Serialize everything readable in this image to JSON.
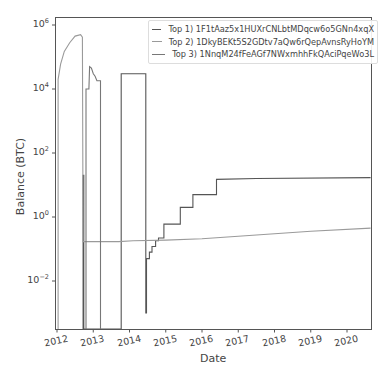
{
  "chart_data": {
    "type": "line",
    "title": "",
    "xlabel": "Date",
    "ylabel": "Balance (BTC)",
    "yscale": "log",
    "xlim": [
      2011.95,
      2020.65
    ],
    "ylim": [
      0.0003,
      1500000
    ],
    "grid": false,
    "legend_position": "upper right",
    "x_ticks": [
      "2012",
      "2013",
      "2014",
      "2015",
      "2016",
      "2017",
      "2018",
      "2019",
      "2020"
    ],
    "y_ticks": [
      {
        "base": "10",
        "exp": "6",
        "value": 1000000
      },
      {
        "base": "10",
        "exp": "4",
        "value": 10000
      },
      {
        "base": "10",
        "exp": "2",
        "value": 100
      },
      {
        "base": "10",
        "exp": "0",
        "value": 1
      },
      {
        "base": "10",
        "exp": "−2",
        "value": 0.01
      }
    ],
    "series": [
      {
        "name": "Top 1) 1F1tAaz5x1HUXrCNLbtMDqcw6o5GNn4xqX",
        "color": "#555555",
        "points": [
          [
            2012.72,
            0.0003
          ],
          [
            2012.72,
            20
          ],
          [
            2012.74,
            20
          ],
          [
            2012.74,
            0.0003
          ],
          [
            2013.77,
            0.0003
          ],
          [
            2013.77,
            30000
          ],
          [
            2014.45,
            30000
          ],
          [
            2014.45,
            0.001
          ],
          [
            2014.47,
            0.001
          ],
          [
            2014.47,
            0.05
          ],
          [
            2014.55,
            0.05
          ],
          [
            2014.55,
            0.08
          ],
          [
            2014.62,
            0.08
          ],
          [
            2014.62,
            0.12
          ],
          [
            2014.72,
            0.12
          ],
          [
            2014.72,
            0.18
          ],
          [
            2014.8,
            0.18
          ],
          [
            2014.8,
            0.22
          ],
          [
            2014.95,
            0.22
          ],
          [
            2014.95,
            0.6
          ],
          [
            2015.4,
            0.6
          ],
          [
            2015.4,
            2
          ],
          [
            2015.75,
            2
          ],
          [
            2015.75,
            5
          ],
          [
            2016.4,
            5
          ],
          [
            2016.4,
            15
          ],
          [
            2017.5,
            16
          ],
          [
            2020.65,
            17
          ]
        ]
      },
      {
        "name": "Top 2) 1DkyBEKt5S2GDtv7aQw6rQepAvnsRyHoYM",
        "color": "#9a9a9a",
        "points": [
          [
            2012.03,
            0.0003
          ],
          [
            2012.03,
            20000
          ],
          [
            2012.1,
            60000
          ],
          [
            2012.2,
            150000
          ],
          [
            2012.35,
            280000
          ],
          [
            2012.5,
            450000
          ],
          [
            2012.65,
            500000
          ],
          [
            2012.7,
            420000
          ],
          [
            2012.72,
            0.17
          ],
          [
            2013.7,
            0.17
          ],
          [
            2014.1,
            0.18
          ],
          [
            2015.0,
            0.19
          ],
          [
            2016.0,
            0.21
          ],
          [
            2017.0,
            0.25
          ],
          [
            2018.0,
            0.3
          ],
          [
            2019.0,
            0.36
          ],
          [
            2020.65,
            0.45
          ]
        ]
      },
      {
        "name": "Top 3) 1NnqM24fFeAGf7NWxmhhFkQAciPqeWo3L",
        "color": "#777777",
        "points": [
          [
            2012.8,
            0.0003
          ],
          [
            2012.8,
            10000
          ],
          [
            2012.88,
            10000
          ],
          [
            2012.9,
            50000
          ],
          [
            2012.95,
            45000
          ],
          [
            2013.0,
            30000
          ],
          [
            2013.05,
            25000
          ],
          [
            2013.1,
            18000
          ],
          [
            2013.2,
            18000
          ],
          [
            2013.2,
            0.0003
          ]
        ]
      }
    ]
  },
  "legend": {
    "items": [
      {
        "label": "Top 1) 1F1tAaz5x1HUXrCNLbtMDqcw6o5GNn4xqX",
        "color": "#555555"
      },
      {
        "label": "Top 2) 1DkyBEKt5S2GDtv7aQw6rQepAvnsRyHoYM",
        "color": "#9a9a9a"
      },
      {
        "label": "Top 3) 1NnqM24fFeAGf7NWxmhhFkQAciPqeWo3L",
        "color": "#777777"
      }
    ]
  },
  "axes": {
    "xlabel": "Date",
    "ylabel": "Balance (BTC)",
    "x_ticks": [
      "2012",
      "2013",
      "2014",
      "2015",
      "2016",
      "2017",
      "2018",
      "2019",
      "2020"
    ]
  }
}
